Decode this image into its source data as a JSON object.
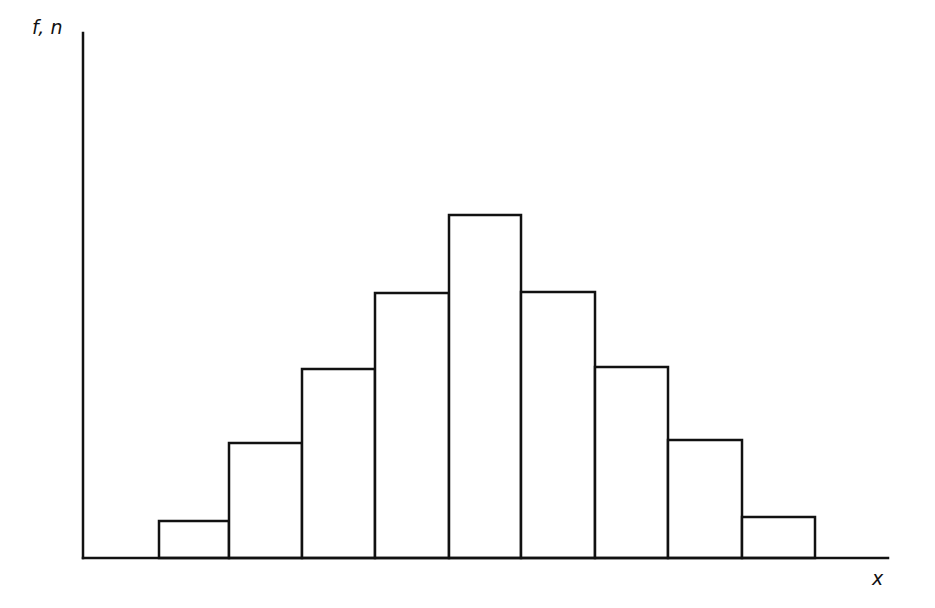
{
  "chart_data": {
    "type": "bar",
    "subtype": "histogram",
    "title": "",
    "xlabel": "x",
    "ylabel": "f, n",
    "categories": [
      "1",
      "2",
      "3",
      "4",
      "5",
      "6",
      "7",
      "8",
      "9"
    ],
    "values": [
      1,
      3,
      5,
      7,
      9,
      7,
      5,
      3,
      1
    ],
    "ylim": [
      0,
      14
    ],
    "grid": false,
    "legend": null,
    "tick_labels_shown": false,
    "bar_fill": "#ffffff",
    "bar_stroke": "#111111",
    "axis_color": "#111111"
  },
  "layout": {
    "origin": {
      "x": 83,
      "y": 558
    },
    "x_axis_end": 888,
    "y_axis_top": 33,
    "bar_left_edges": [
      159,
      229,
      302,
      375,
      449,
      521,
      595,
      668,
      742
    ],
    "bar_right_edge": 815,
    "bar_tops": [
      521,
      443,
      369,
      293,
      215,
      292,
      367,
      440,
      517
    ]
  }
}
